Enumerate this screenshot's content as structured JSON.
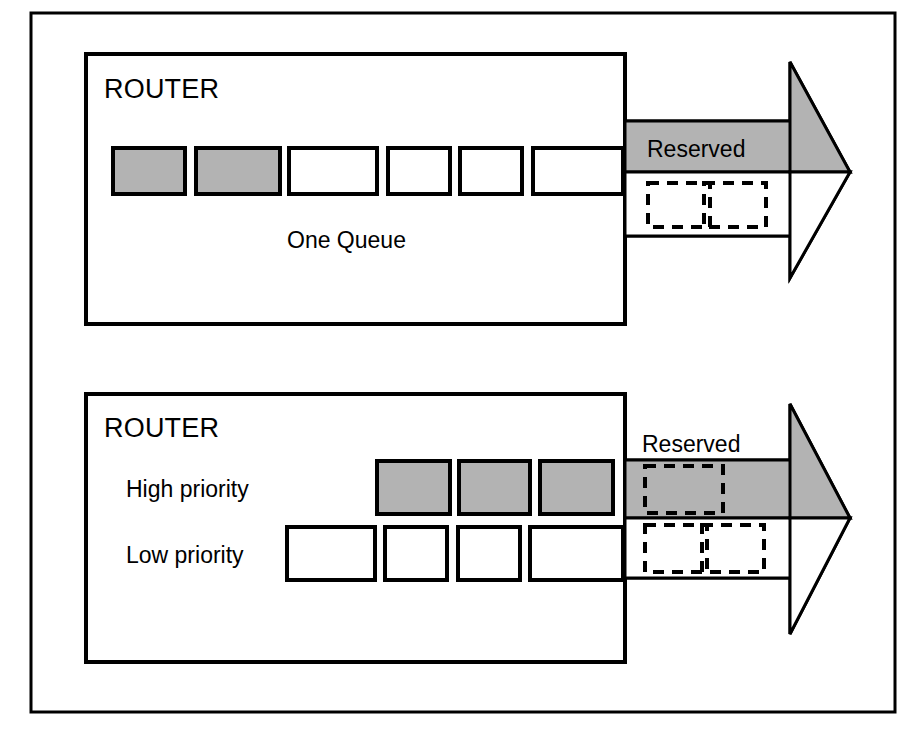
{
  "figure": {
    "background_color": "#ffffff",
    "line_color": "#000000",
    "fill_gray": "#b3b3b3",
    "outer_frame": {
      "x": 31,
      "y": 13,
      "width": 864,
      "height": 699
    }
  },
  "panels": [
    {
      "id": "top-panel",
      "router_label": "ROUTER",
      "queue_caption": "One Queue",
      "reserved_label": "Reserved",
      "reserved_label_position": "inside-gray-band",
      "box": {
        "x": 86,
        "y": 54,
        "width": 539,
        "height": 270
      },
      "packets": [
        {
          "index": 0,
          "fill": "gray",
          "x": 113,
          "y": 148,
          "width": 72,
          "height": 46
        },
        {
          "index": 1,
          "fill": "gray",
          "x": 196,
          "y": 148,
          "width": 84,
          "height": 46
        },
        {
          "index": 2,
          "fill": "white",
          "x": 289,
          "y": 148,
          "width": 88,
          "height": 46
        },
        {
          "index": 3,
          "fill": "white",
          "x": 388,
          "y": 148,
          "width": 62,
          "height": 46
        },
        {
          "index": 4,
          "fill": "white",
          "x": 460,
          "y": 148,
          "width": 62,
          "height": 46
        },
        {
          "index": 5,
          "fill": "white",
          "x": 533,
          "y": 148,
          "width": 92,
          "height": 46
        }
      ],
      "reserved_band": {
        "x": 625,
        "y": 121,
        "width": 165,
        "height": 51,
        "fill": "gray"
      },
      "best_effort_band": {
        "x": 625,
        "y": 172,
        "width": 165,
        "height": 64,
        "fill": "white"
      },
      "reserved_band_dashed_slots": [],
      "best_effort_dashed_slots": [
        {
          "index": 0,
          "x": 648,
          "y": 183,
          "width": 62,
          "height": 44
        },
        {
          "index": 1,
          "x": 704,
          "y": 183,
          "width": 62,
          "height": 44
        }
      ],
      "arrow": {
        "base_x": 790,
        "tip_x": 850,
        "top_y": 62,
        "bottom_y": 278,
        "mid_y": 172,
        "upper_fill": "gray",
        "lower_fill": "white"
      }
    },
    {
      "id": "bottom-panel",
      "router_label": "ROUTER",
      "high_priority_label": "High priority",
      "low_priority_label": "Low priority",
      "reserved_label": "Reserved",
      "reserved_label_position": "above-gray-band",
      "box": {
        "x": 86,
        "y": 394,
        "width": 539,
        "height": 268
      },
      "high_priority_packets": [
        {
          "index": 0,
          "fill": "gray",
          "x": 377,
          "y": 461,
          "width": 73,
          "height": 53
        },
        {
          "index": 1,
          "fill": "gray",
          "x": 459,
          "y": 461,
          "width": 71,
          "height": 53
        },
        {
          "index": 2,
          "fill": "gray",
          "x": 540,
          "y": 461,
          "width": 73,
          "height": 53
        }
      ],
      "low_priority_packets": [
        {
          "index": 0,
          "fill": "white",
          "x": 287,
          "y": 527,
          "width": 88,
          "height": 53
        },
        {
          "index": 1,
          "fill": "white",
          "x": 385,
          "y": 527,
          "width": 62,
          "height": 53
        },
        {
          "index": 2,
          "fill": "white",
          "x": 458,
          "y": 527,
          "width": 62,
          "height": 53
        },
        {
          "index": 3,
          "fill": "white",
          "x": 530,
          "y": 527,
          "width": 95,
          "height": 53
        }
      ],
      "reserved_band": {
        "x": 625,
        "y": 460,
        "width": 165,
        "height": 58,
        "fill": "gray"
      },
      "best_effort_band": {
        "x": 625,
        "y": 518,
        "width": 165,
        "height": 60,
        "fill": "white"
      },
      "reserved_band_dashed_slots": [
        {
          "index": 0,
          "x": 645,
          "y": 466,
          "width": 78,
          "height": 47
        }
      ],
      "best_effort_dashed_slots": [
        {
          "index": 0,
          "x": 645,
          "y": 525,
          "width": 62,
          "height": 47
        },
        {
          "index": 1,
          "x": 702,
          "y": 525,
          "width": 62,
          "height": 47
        }
      ],
      "arrow": {
        "base_x": 790,
        "tip_x": 850,
        "top_y": 404,
        "bottom_y": 634,
        "mid_y": 518,
        "upper_fill": "gray",
        "lower_fill": "white"
      },
      "reserved_label_xy": {
        "x": 710,
        "y": 448
      }
    }
  ]
}
